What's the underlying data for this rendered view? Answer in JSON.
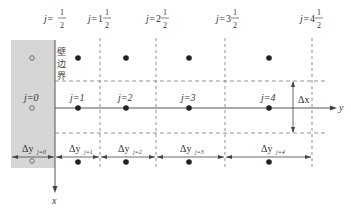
{
  "diagram": {
    "title": "",
    "wall": {
      "label": "j=0",
      "boundary_label": [
        "壁",
        "边",
        "界"
      ],
      "width_label": "Δy",
      "width_sub": "j=0",
      "fill_color": "#d6d6d6"
    },
    "half_index_labels": [
      {
        "prefix": "j=",
        "whole": "",
        "num": "1",
        "den": "2"
      },
      {
        "prefix": "j=",
        "whole": "1",
        "num": "1",
        "den": "2"
      },
      {
        "prefix": "j=",
        "whole": "2",
        "num": "1",
        "den": "2"
      },
      {
        "prefix": "j=",
        "whole": "3",
        "num": "1",
        "den": "2"
      },
      {
        "prefix": "j=",
        "whole": "4",
        "num": "1",
        "den": "2"
      }
    ],
    "node_labels": [
      "j=1",
      "j=2",
      "j=3",
      "j=4"
    ],
    "spacing_labels": [
      {
        "main": "Δy",
        "sub": "j=1"
      },
      {
        "main": "Δy",
        "sub": "j=2"
      },
      {
        "main": "Δy",
        "sub": "j=3"
      },
      {
        "main": "Δy",
        "sub": "j=4"
      }
    ],
    "dx_label": "Δx",
    "axes": {
      "y_label": "y",
      "x_label": "x"
    },
    "colors": {
      "line": "#555555",
      "dash": "#777777",
      "dot": "#222222",
      "wall_edge": "#555555"
    }
  }
}
